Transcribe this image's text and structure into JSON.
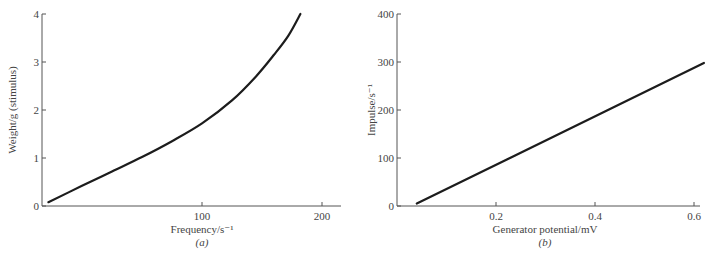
{
  "chart_data": [
    {
      "type": "line",
      "panel_label": "(a)",
      "title": "",
      "xlabel": "Frequency/s⁻¹",
      "ylabel": "Weight/g (stimulus)",
      "xlim": [
        -33,
        215
      ],
      "ylim": [
        0,
        4
      ],
      "x_ticks": [
        100,
        200
      ],
      "x_tick_labels": [
        "100",
        "200"
      ],
      "y_ticks": [
        0,
        1,
        2,
        3,
        4
      ],
      "y_tick_labels": [
        "0",
        "1",
        "2",
        "3",
        "4"
      ],
      "grid": false,
      "legend": null,
      "series": [
        {
          "name": "weight vs frequency",
          "x": [
            -28,
            0,
            25,
            50,
            75,
            100,
            125,
            145,
            160,
            172,
            182
          ],
          "y": [
            0.08,
            0.42,
            0.72,
            1.02,
            1.35,
            1.72,
            2.2,
            2.7,
            3.15,
            3.55,
            4.0
          ]
        }
      ]
    },
    {
      "type": "line",
      "panel_label": "(b)",
      "title": "",
      "xlabel": "Generator potential/mV",
      "ylabel": "Impulse/s⁻¹",
      "xlim": [
        0,
        0.62
      ],
      "ylim": [
        0,
        400
      ],
      "x_ticks": [
        0.2,
        0.4,
        0.6
      ],
      "x_tick_labels": [
        "0.2",
        "0.4",
        "0.6"
      ],
      "y_ticks": [
        0,
        100,
        200,
        300,
        400
      ],
      "y_tick_labels": [
        "0",
        "100",
        "200",
        "300",
        "400"
      ],
      "grid": false,
      "legend": null,
      "series": [
        {
          "name": "impulse vs generator potential",
          "x": [
            0.04,
            0.62
          ],
          "y": [
            5,
            298
          ]
        }
      ]
    }
  ]
}
